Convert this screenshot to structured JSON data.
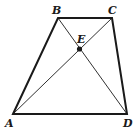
{
  "diagram": {
    "type": "trapezoid-with-diagonals",
    "points": {
      "A": {
        "label": "A",
        "x": 13,
        "y": 114
      },
      "B": {
        "label": "B",
        "x": 58,
        "y": 18
      },
      "C": {
        "label": "C",
        "x": 112,
        "y": 18
      },
      "D": {
        "label": "D",
        "x": 127,
        "y": 114
      },
      "E": {
        "label": "E",
        "x": 80,
        "y": 49
      }
    },
    "sides": [
      "AB",
      "BC",
      "CD",
      "DA"
    ],
    "diagonals": [
      "AC",
      "BD"
    ],
    "intersection": "E",
    "colors": {
      "stroke": "#1a1a1a",
      "background": "#ffffff"
    }
  }
}
